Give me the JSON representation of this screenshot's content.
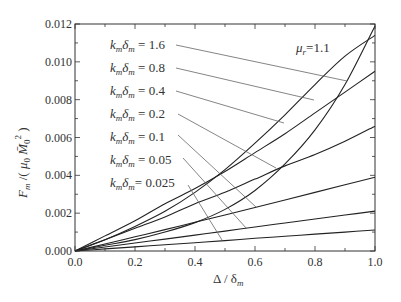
{
  "chart_data": {
    "type": "line",
    "title": "",
    "xlabel": "Δ / δ_m",
    "ylabel": "F_m / ( μ0 M̄0² )",
    "xlim": [
      0.0,
      1.0
    ],
    "ylim": [
      0.0,
      0.012
    ],
    "x_ticks": [
      "0.0",
      "0.2",
      "0.4",
      "0.6",
      "0.8",
      "1.0"
    ],
    "y_ticks": [
      "0.000",
      "0.002",
      "0.004",
      "0.006",
      "0.008",
      "0.010",
      "0.012"
    ],
    "grid": false,
    "legend_position": "inline annotations with leader lines",
    "annotation": "μr=1.1",
    "x": [
      0.0,
      0.1,
      0.2,
      0.3,
      0.4,
      0.5,
      0.6,
      0.7,
      0.8,
      0.9,
      1.0
    ],
    "series": [
      {
        "name": "kmδm = 1.6",
        "values": [
          0.0,
          0.0003,
          0.0006,
          0.001,
          0.0015,
          0.0022,
          0.0032,
          0.0046,
          0.0064,
          0.0088,
          0.0119
        ]
      },
      {
        "name": "kmδm = 0.8",
        "values": [
          0.0,
          0.0006,
          0.0013,
          0.0021,
          0.0031,
          0.0043,
          0.0057,
          0.0072,
          0.0088,
          0.0103,
          0.0114
        ]
      },
      {
        "name": "kmδm = 0.4",
        "values": [
          0.0,
          0.0008,
          0.0016,
          0.0025,
          0.0033,
          0.0042,
          0.0052,
          0.0062,
          0.0073,
          0.0084,
          0.0095
        ]
      },
      {
        "name": "kmδm = 0.2",
        "values": [
          0.0,
          0.0006,
          0.0012,
          0.0018,
          0.0025,
          0.0031,
          0.0038,
          0.0045,
          0.0051,
          0.0058,
          0.0066
        ]
      },
      {
        "name": "kmδm = 0.1",
        "values": [
          0.0,
          0.00037,
          0.00075,
          0.00113,
          0.00152,
          0.0019,
          0.0023,
          0.0027,
          0.0031,
          0.0035,
          0.0039
        ]
      },
      {
        "name": "kmδm = 0.05",
        "values": [
          0.0,
          0.00021,
          0.00042,
          0.00063,
          0.00084,
          0.00105,
          0.00127,
          0.00148,
          0.00169,
          0.0019,
          0.00211
        ]
      },
      {
        "name": "kmδm = 0.025",
        "values": [
          0.0,
          0.00011,
          0.00022,
          0.00033,
          0.00044,
          0.00055,
          0.00067,
          0.00078,
          0.00089,
          0.001,
          0.00111
        ]
      }
    ]
  },
  "labels": {
    "series_labels": [
      {
        "k": "k",
        "k_sub": "m",
        "d": "δ",
        "d_sub": "m",
        "value": " = 1.6"
      },
      {
        "k": "k",
        "k_sub": "m",
        "d": "δ",
        "d_sub": "m",
        "value": " = 0.8"
      },
      {
        "k": "k",
        "k_sub": "m",
        "d": "δ",
        "d_sub": "m",
        "value": " = 0.4"
      },
      {
        "k": "k",
        "k_sub": "m",
        "d": "δ",
        "d_sub": "m",
        "value": " = 0.2"
      },
      {
        "k": "k",
        "k_sub": "m",
        "d": "δ",
        "d_sub": "m",
        "value": " = 0.1"
      },
      {
        "k": "k",
        "k_sub": "m",
        "d": "δ",
        "d_sub": "m",
        "value": " = 0.05"
      },
      {
        "k": "k",
        "k_sub": "m",
        "d": "δ",
        "d_sub": "m",
        "value": "= 0.025"
      }
    ],
    "mu_symbol": "μ",
    "mu_sub": "r",
    "mu_value": "=1.1",
    "xlabel_main": "Δ / δ",
    "xlabel_sub": "m",
    "ylabel_F": "F",
    "ylabel_F_sub": "m",
    "ylabel_rest1": " /( ",
    "ylabel_mu": "μ",
    "ylabel_mu_sub": "0",
    "ylabel_M": " M̄",
    "ylabel_M_sub": "0",
    "ylabel_M_sup": "2",
    "ylabel_close": " )"
  }
}
